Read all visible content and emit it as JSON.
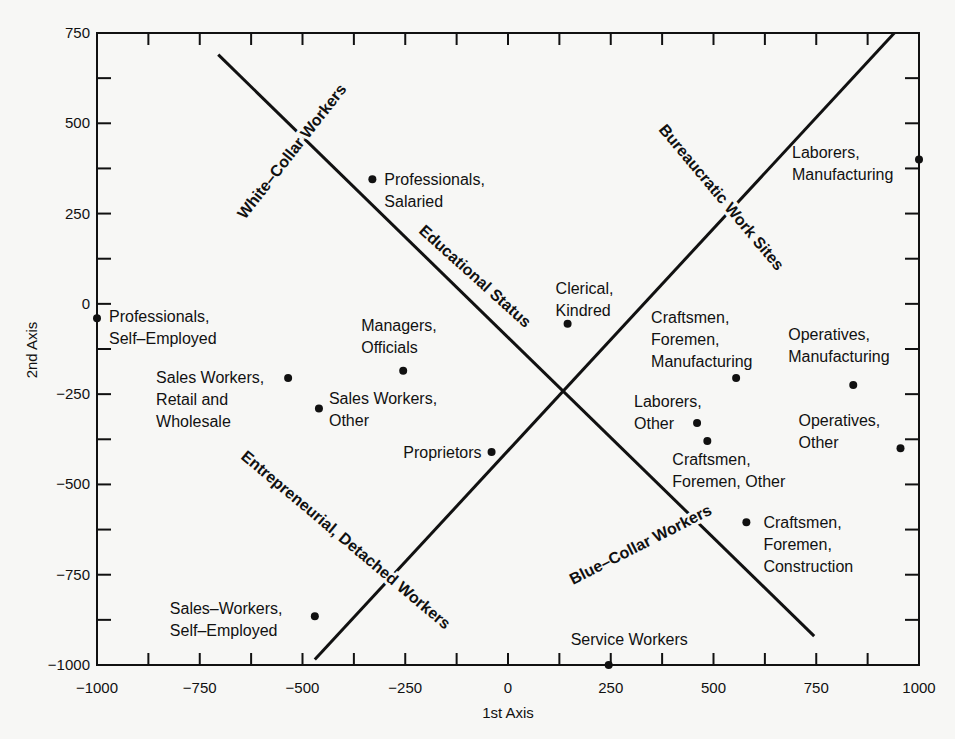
{
  "chart_data": {
    "type": "scatter",
    "title": "",
    "xlabel": "1st Axis",
    "ylabel": "2nd Axis",
    "xlim": [
      -1000,
      1000
    ],
    "ylim": [
      -1000,
      750
    ],
    "x_ticks": [
      -1000,
      -750,
      -500,
      -250,
      0,
      250,
      500,
      750,
      1000
    ],
    "x_tick_labels": [
      "−1000",
      "−750",
      "−500",
      "−250",
      "0",
      "250",
      "500",
      "750",
      "1000"
    ],
    "y_ticks": [
      750,
      500,
      250,
      0,
      -250,
      -500,
      -750,
      -1000
    ],
    "y_tick_labels": [
      "750",
      "500",
      "250",
      "0",
      "−250",
      "−500",
      "−750",
      "−1000"
    ],
    "minor_tick_step": 125,
    "grid": false,
    "legend": null,
    "points": [
      {
        "label": [
          "Professionals,",
          "Self–Employed"
        ],
        "x": -1000,
        "y": -40,
        "lx": 12,
        "ly": 4,
        "anchor": "start"
      },
      {
        "label": [
          "Professionals,",
          "Salaried"
        ],
        "x": -330,
        "y": 345,
        "lx": 12,
        "ly": 6,
        "anchor": "start"
      },
      {
        "label": [
          "Clerical,",
          "Kindred"
        ],
        "x": 145,
        "y": -55,
        "lx": -12,
        "ly": -30,
        "anchor": "start"
      },
      {
        "label": [
          "Managers,",
          "Officials"
        ],
        "x": -255,
        "y": -185,
        "lx": -42,
        "ly": -40,
        "anchor": "start"
      },
      {
        "label": [
          "Sales Workers,",
          "Retail and",
          "Wholesale"
        ],
        "x": -535,
        "y": -205,
        "lx": -12,
        "ly": 5,
        "anchor": "end-first"
      },
      {
        "label": [
          "Sales Workers,",
          "Other"
        ],
        "x": -460,
        "y": -290,
        "lx": 10,
        "ly": -5,
        "anchor": "start"
      },
      {
        "label": [
          "Proprietors"
        ],
        "x": -40,
        "y": -410,
        "lx": -10,
        "ly": 6,
        "anchor": "end"
      },
      {
        "label": [
          "Craftsmen,",
          "Foremen,",
          "Manufacturing"
        ],
        "x": 555,
        "y": -205,
        "lx": -85,
        "ly": -55,
        "anchor": "start"
      },
      {
        "label": [
          "Operatives,",
          "Manufacturing"
        ],
        "x": 840,
        "y": -225,
        "lx": -65,
        "ly": -45,
        "anchor": "start"
      },
      {
        "label": [
          "Laborers,",
          "Other"
        ],
        "x": 460,
        "y": -330,
        "lx": -63,
        "ly": -16,
        "anchor": "start"
      },
      {
        "label": [
          "Craftsmen,",
          "Foremen, Other"
        ],
        "x": 485,
        "y": -380,
        "lx": -35,
        "ly": 24,
        "anchor": "start"
      },
      {
        "label": [
          "Operatives,",
          "Other"
        ],
        "x": 955,
        "y": -400,
        "lx": -102,
        "ly": -22,
        "anchor": "start"
      },
      {
        "label": [
          "Laborers,",
          "Manufacturing"
        ],
        "x": 1000,
        "y": 400,
        "lx": -127,
        "ly": -1,
        "anchor": "start"
      },
      {
        "label": [
          "Craftsmen,",
          "Foremen,",
          "Construction"
        ],
        "x": 580,
        "y": -605,
        "lx": 17,
        "ly": 6,
        "anchor": "start"
      },
      {
        "label": [
          "Service Workers"
        ],
        "x": 245,
        "y": -1000,
        "lx": -38,
        "ly": -20,
        "anchor": "start"
      },
      {
        "label": [
          "Sales–Workers,",
          "Self–Employed"
        ],
        "x": -470,
        "y": -865,
        "lx": -145,
        "ly": -2,
        "anchor": "start"
      }
    ],
    "dimension_lines": [
      {
        "name": "descending",
        "x1": -705,
        "y1": 690,
        "x2": 745,
        "y2": -920
      },
      {
        "name": "ascending",
        "x1": -470,
        "y1": -985,
        "x2": 940,
        "y2": 750
      }
    ],
    "region_labels": [
      {
        "text": "White–Collar Workers",
        "px": 245,
        "py": 220,
        "rotate": -52
      },
      {
        "text": "Educational Status",
        "px": 418,
        "py": 232,
        "rotate": 42
      },
      {
        "text": "Bureaucratic Work Sites",
        "px": 658,
        "py": 130,
        "rotate": 50
      },
      {
        "text": "Entrepreneurial, Detached Workers",
        "px": 240,
        "py": 458,
        "rotate": 40
      },
      {
        "text": "Blue–Collar Workers",
        "px": 573,
        "py": 585,
        "rotate": -27
      }
    ]
  }
}
